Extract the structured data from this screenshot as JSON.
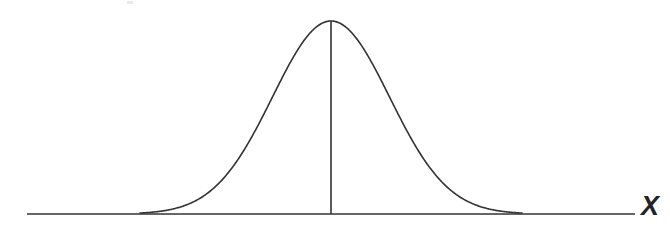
{
  "figure": {
    "kind": "statistical-illustration",
    "background_color": "#ffffff",
    "stroke_color": "#333333",
    "axis_label_x": "X",
    "axis_label_x_style": "italic",
    "width": 670,
    "height": 235
  },
  "chart_data": {
    "type": "line",
    "title": "",
    "subtitle": "",
    "xlabel": "X",
    "ylabel": "",
    "grid": false,
    "legend": null,
    "legend_position": "none",
    "axis": {
      "x_start_px": 27,
      "x_end_px": 635,
      "baseline_y_px": 214,
      "ticks": [],
      "tick_labels": []
    },
    "curve": {
      "distribution": "normal",
      "mean_px": 331,
      "sigma_px": 58.5,
      "peak_x_px": 331,
      "peak_y_px": 21,
      "amplitude_px": 193,
      "x_domain_px": [
        140,
        522
      ],
      "stroke_width": 1.6,
      "stroke_color": "#333333",
      "fill": "none"
    },
    "mean_line": {
      "x_px": 331,
      "y_top_px": 21,
      "y_bottom_px": 214,
      "stroke_width": 1.6,
      "stroke_color": "#333333"
    },
    "x": [
      140,
      160,
      180,
      200,
      220,
      240,
      260,
      280,
      300,
      310,
      320,
      331,
      342,
      352,
      362,
      382,
      402,
      422,
      442,
      462,
      482,
      502,
      522
    ],
    "y": [
      214.0,
      212.4,
      208.2,
      200.0,
      186.5,
      167.1,
      142.4,
      114.5,
      86.7,
      73.8,
      62.5,
      53.6,
      49.9,
      52.9,
      62.5,
      86.7,
      114.5,
      142.4,
      167.1,
      186.5,
      200.0,
      208.2,
      212.4
    ],
    "y_values_are_pixel_rows": true,
    "annotations": [
      {
        "text": "X",
        "x_px": 653,
        "y_px": 207,
        "style": "italic",
        "role": "axis-label"
      }
    ]
  }
}
